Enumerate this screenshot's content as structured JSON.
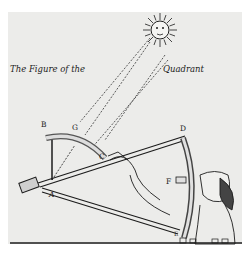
{
  "engraving": {
    "title_left": "The Figure of the",
    "title_right": "Quadrant",
    "point_labels": {
      "A": "A",
      "B": "B",
      "C": "C",
      "D": "D",
      "E": "E",
      "F": "F",
      "G": "G"
    },
    "colors": {
      "ink": "#1c1c1c",
      "paper": "#ececea",
      "background": "#ffffff"
    }
  }
}
